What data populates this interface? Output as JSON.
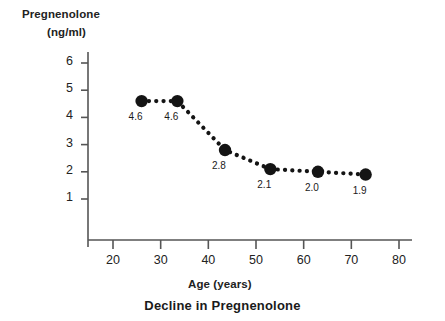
{
  "chart_data": {
    "type": "line",
    "title": "Decline in Pregnenolone",
    "xlabel": "Age (years)",
    "ylabel_line1": "Pregnenolone",
    "ylabel_line2": "(ng/ml)",
    "x": [
      26,
      33.5,
      43.5,
      53,
      63,
      73
    ],
    "values": [
      4.6,
      4.6,
      2.8,
      2.1,
      2.0,
      1.9
    ],
    "point_labels": [
      "4.6",
      "4.6",
      "2.8",
      "2.1",
      "2.0",
      "1.9"
    ],
    "xtick_labels": [
      "20",
      "30",
      "40",
      "50",
      "60",
      "70",
      "80"
    ],
    "xticks": [
      20,
      30,
      40,
      50,
      60,
      70,
      80
    ],
    "ytick_labels": [
      "6",
      "5",
      "4",
      "3",
      "2",
      "1"
    ],
    "yticks": [
      6,
      5,
      4,
      3,
      2,
      1
    ],
    "xlim": [
      15,
      85
    ],
    "ylim": [
      0.3,
      6.6
    ],
    "grid": false,
    "legend": "none",
    "line_style": "dotted",
    "marker": "filled-circle",
    "series_color": "#141414",
    "axis_color": "#555555"
  }
}
